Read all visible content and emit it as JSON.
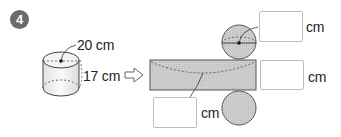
{
  "problem": {
    "number": "4"
  },
  "cylinder": {
    "diameter_label": "20 cm",
    "height_label": "17 cm"
  },
  "net": {
    "top_circle_answer": {
      "value": "",
      "unit": "cm"
    },
    "rectangle_height_answer": {
      "value": "",
      "unit": "cm"
    },
    "rectangle_length_answer": {
      "value": "",
      "unit": "cm"
    }
  },
  "colors": {
    "fill": "#c9c9c9",
    "outline": "#555555",
    "badge": "#6b6b6b",
    "box_border": "#bdbdbd"
  },
  "icons": {
    "arrow": "hollow-right-arrow-icon"
  }
}
